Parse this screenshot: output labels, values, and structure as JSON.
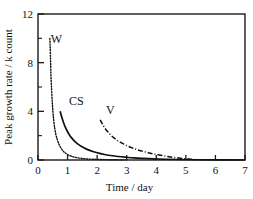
{
  "chart_data": {
    "type": "line",
    "title": "",
    "xlabel": "Time / day",
    "ylabel": "Peak growth rate / k count",
    "xlim": [
      0,
      7
    ],
    "ylim": [
      0,
      12
    ],
    "xticks": [
      "0",
      "1",
      "2",
      "3",
      "4",
      "5",
      "6",
      "7"
    ],
    "xtick_values": [
      0,
      1,
      2,
      3,
      4,
      5,
      6,
      7
    ],
    "yticks": [
      "0",
      "4",
      "8",
      "12"
    ],
    "ytick_values": [
      0,
      4,
      8,
      12
    ],
    "yticks_minor": [
      2,
      6,
      10
    ],
    "grid": false,
    "legend": "inline-curve-labels",
    "series": [
      {
        "name": "W",
        "label": "W",
        "style": "dotted",
        "label_x": 0.62,
        "label_y": 9.6,
        "points": [
          [
            0.4,
            10.0
          ],
          [
            0.41,
            9.4
          ],
          [
            0.42,
            8.6
          ],
          [
            0.43,
            7.7
          ],
          [
            0.44,
            6.8
          ],
          [
            0.46,
            5.8
          ],
          [
            0.48,
            4.9
          ],
          [
            0.5,
            4.1
          ],
          [
            0.53,
            3.3
          ],
          [
            0.56,
            2.7
          ],
          [
            0.6,
            2.15
          ],
          [
            0.65,
            1.7
          ],
          [
            0.7,
            1.35
          ],
          [
            0.76,
            1.05
          ],
          [
            0.82,
            0.82
          ],
          [
            0.9,
            0.62
          ],
          [
            1.0,
            0.45
          ],
          [
            1.12,
            0.32
          ],
          [
            1.25,
            0.22
          ],
          [
            1.45,
            0.14
          ],
          [
            1.7,
            0.08
          ],
          [
            2.0,
            0.05
          ],
          [
            2.5,
            0.02
          ],
          [
            3.0,
            0.01
          ]
        ]
      },
      {
        "name": "CS",
        "label": "CS",
        "style": "solid",
        "label_x": 1.3,
        "label_y": 4.55,
        "points": [
          [
            0.75,
            4.0
          ],
          [
            0.8,
            3.55
          ],
          [
            0.86,
            3.1
          ],
          [
            0.92,
            2.72
          ],
          [
            1.0,
            2.32
          ],
          [
            1.08,
            2.0
          ],
          [
            1.18,
            1.7
          ],
          [
            1.28,
            1.45
          ],
          [
            1.4,
            1.22
          ],
          [
            1.55,
            1.0
          ],
          [
            1.7,
            0.83
          ],
          [
            1.88,
            0.68
          ],
          [
            2.05,
            0.56
          ],
          [
            2.25,
            0.45
          ],
          [
            2.45,
            0.37
          ],
          [
            2.7,
            0.29
          ],
          [
            2.95,
            0.23
          ],
          [
            3.25,
            0.17
          ],
          [
            3.55,
            0.13
          ],
          [
            3.9,
            0.09
          ],
          [
            4.3,
            0.06
          ],
          [
            4.8,
            0.04
          ],
          [
            5.4,
            0.02
          ],
          [
            6.2,
            0.01
          ],
          [
            7.0,
            0.0
          ]
        ]
      },
      {
        "name": "V",
        "label": "V",
        "style": "dash-dot",
        "label_x": 2.45,
        "label_y": 3.75,
        "points": [
          [
            2.1,
            3.3
          ],
          [
            2.18,
            2.95
          ],
          [
            2.26,
            2.62
          ],
          [
            2.36,
            2.32
          ],
          [
            2.46,
            2.05
          ],
          [
            2.58,
            1.8
          ],
          [
            2.7,
            1.58
          ],
          [
            2.84,
            1.38
          ],
          [
            3.0,
            1.18
          ],
          [
            3.16,
            1.02
          ],
          [
            3.34,
            0.86
          ],
          [
            3.52,
            0.73
          ],
          [
            3.72,
            0.6
          ],
          [
            3.92,
            0.49
          ],
          [
            4.14,
            0.39
          ],
          [
            4.36,
            0.3
          ],
          [
            4.58,
            0.22
          ],
          [
            4.8,
            0.15
          ],
          [
            5.0,
            0.1
          ],
          [
            5.2,
            0.06
          ]
        ]
      }
    ]
  }
}
